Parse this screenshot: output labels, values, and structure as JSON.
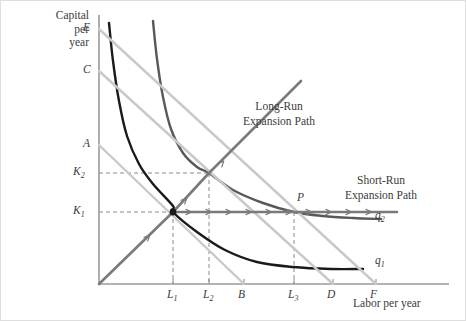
{
  "figure": {
    "axes": {
      "y_title": [
        "Capital",
        "per",
        "year"
      ],
      "x_title": "Labor per year",
      "y_ticks": [
        {
          "label": "E",
          "y": 28
        },
        {
          "label": "C",
          "y": 70
        },
        {
          "label": "A",
          "y": 144
        },
        {
          "label": "K",
          "sub": "2",
          "y": 172
        },
        {
          "label": "K",
          "sub": "1",
          "y": 211
        }
      ],
      "x_ticks": [
        {
          "label": "L",
          "sub": "1",
          "x": 172
        },
        {
          "label": "L",
          "sub": "2",
          "x": 208
        },
        {
          "label": "B",
          "sub": "",
          "x": 243
        },
        {
          "label": "L",
          "sub": "3",
          "x": 293
        },
        {
          "label": "D",
          "sub": "",
          "x": 332
        },
        {
          "label": "F",
          "sub": "",
          "x": 375
        }
      ]
    },
    "annotations": [
      {
        "name": "long-run-expansion-path-label",
        "lines": [
          "Long-Run",
          "Expansion Path"
        ],
        "x": 278,
        "y": 98
      },
      {
        "name": "short-run-expansion-path-label",
        "lines": [
          "Short-Run",
          "Expansion Path"
        ],
        "x": 380,
        "y": 172
      }
    ],
    "curve_labels": [
      {
        "name": "isoquant-q2-label",
        "label": "q",
        "sub": "2",
        "x": 374,
        "y": 216
      },
      {
        "name": "isoquant-q1-label",
        "label": "q",
        "sub": "1",
        "x": 374,
        "y": 261
      }
    ],
    "point_labels": [
      {
        "name": "point-p-label",
        "label": "P",
        "x": 296,
        "y": 198
      }
    ],
    "colors": {
      "axis": "#9a9a9a",
      "isoquant_q1": "#1a1a1a",
      "isoquant_q2": "#595959",
      "isocost_light": "#c9c9c9",
      "expansion_path": "#7a7a7a",
      "dashed": "#8a8a8a",
      "text": "#3b3b3b",
      "border": "#dedede"
    }
  },
  "chart_data": {
    "type": "line",
    "title": "",
    "xlabel": "Labor per year",
    "ylabel": "Capital per year",
    "grid": false,
    "legend": "none",
    "origin_px": [
      98,
      283
    ],
    "axis_ranges_px": {
      "x": [
        98,
        448
      ],
      "y": [
        14,
        283
      ]
    },
    "key_points": [
      {
        "name": "long-run-optimum-q1",
        "label": "",
        "x_tick": "L1",
        "y_tick": "K1",
        "px": [
          172,
          211
        ]
      },
      {
        "name": "long-run-optimum-q2",
        "label": "",
        "x_tick": "L2",
        "y_tick": "K2",
        "px": [
          208,
          172
        ]
      },
      {
        "name": "short-run-optimum-q2",
        "label": "P",
        "x_tick": "L3",
        "y_tick": "K1",
        "px": [
          293,
          211
        ]
      }
    ],
    "series": [
      {
        "name": "isoquant-q1",
        "label": "q1",
        "type": "isoquant",
        "color": "#1a1a1a",
        "width": 2.4,
        "points": [
          [
            108,
            22
          ],
          [
            112,
            60
          ],
          [
            118,
            100
          ],
          [
            126,
            135
          ],
          [
            138,
            163
          ],
          [
            152,
            183
          ],
          [
            172,
            205
          ],
          [
            172,
            211
          ],
          [
            196,
            231
          ],
          [
            224,
            249
          ],
          [
            256,
            261
          ],
          [
            292,
            266
          ],
          [
            330,
            268
          ],
          [
            362,
            268
          ]
        ]
      },
      {
        "name": "isoquant-q2",
        "label": "q2",
        "type": "isoquant",
        "color": "#595959",
        "width": 2.4,
        "points": [
          [
            152,
            20
          ],
          [
            156,
            58
          ],
          [
            162,
            96
          ],
          [
            170,
            128
          ],
          [
            182,
            152
          ],
          [
            196,
            166
          ],
          [
            208,
            172
          ],
          [
            232,
            189
          ],
          [
            262,
            202
          ],
          [
            293,
            211
          ],
          [
            322,
            215
          ],
          [
            352,
            217
          ],
          [
            380,
            218
          ]
        ]
      },
      {
        "name": "isocost-A-B",
        "label": "A to B",
        "type": "isocost",
        "color": "#c9c9c9",
        "width": 2.4,
        "points": [
          [
            98,
            144
          ],
          [
            243,
            283
          ]
        ]
      },
      {
        "name": "isocost-C-D",
        "label": "C to D",
        "type": "isocost",
        "color": "#c9c9c9",
        "width": 2.4,
        "points": [
          [
            98,
            70
          ],
          [
            332,
            283
          ]
        ]
      },
      {
        "name": "isocost-E-F",
        "label": "E to F",
        "type": "isocost",
        "color": "#c9c9c9",
        "width": 2.4,
        "points": [
          [
            98,
            28
          ],
          [
            375,
            283
          ]
        ]
      },
      {
        "name": "long-run-expansion-path",
        "label": "Long-Run Expansion Path",
        "type": "expansion-path",
        "color": "#7a7a7a",
        "width": 2.6,
        "points": [
          [
            98,
            283
          ],
          [
            172,
            211
          ],
          [
            208,
            172
          ],
          [
            262,
            118
          ],
          [
            300,
            80
          ]
        ],
        "arrows_px": [
          [
            147,
            236
          ],
          [
            184,
            199
          ],
          [
            221,
            162
          ]
        ]
      },
      {
        "name": "short-run-expansion-path",
        "label": "Short-Run Expansion Path",
        "type": "expansion-path",
        "color": "#7a7a7a",
        "width": 2.6,
        "points": [
          [
            172,
            211
          ],
          [
            396,
            211
          ]
        ],
        "arrows_px": [
          [
            188,
            211
          ],
          [
            208,
            211
          ],
          [
            228,
            211
          ],
          [
            248,
            211
          ],
          [
            268,
            211
          ],
          [
            288,
            211
          ],
          [
            308,
            211
          ],
          [
            328,
            211
          ],
          [
            348,
            211
          ],
          [
            368,
            211
          ]
        ]
      }
    ],
    "dashed_guides": [
      {
        "name": "guide-K1-horizontal",
        "from_px": [
          98,
          211
        ],
        "to_px": [
          293,
          211
        ]
      },
      {
        "name": "guide-K2-horizontal",
        "from_px": [
          98,
          172
        ],
        "to_px": [
          208,
          172
        ]
      },
      {
        "name": "guide-L1-vertical",
        "from_px": [
          172,
          211
        ],
        "to_px": [
          172,
          283
        ]
      },
      {
        "name": "guide-L2-vertical",
        "from_px": [
          208,
          172
        ],
        "to_px": [
          208,
          283
        ]
      },
      {
        "name": "guide-L3-vertical",
        "from_px": [
          293,
          211
        ],
        "to_px": [
          293,
          283
        ]
      }
    ]
  }
}
